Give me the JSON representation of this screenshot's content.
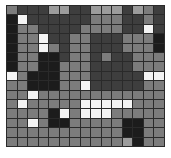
{
  "grid": {
    "rows": 15,
    "cols": 15,
    "palette": {
      "W": "#f4f4f4",
      "L": "#9c9c9c",
      "M": "#7c7c7c",
      "D": "#3e3e3e",
      "K": "#1c1c1c"
    },
    "cells": [
      "MDDDLLDDLLLDLMD",
      "KWDDDDDDMMMDDMD",
      "KMMDDDDMMMMDDWD",
      "KMMWDDMMDDDMMMK",
      "KMMWMDMMDDDMMMK",
      "KMMKKDMMDMDDMMM",
      "KMMKKMMMDDDDMMM",
      "WMKKKMMMDDDDDWW",
      "MMKKKMMWDDDDDMM",
      "MMWMMMMMMMMMMMM",
      "MWMMMMMWWWWWMMM",
      "MMMMKWMWWWMMMMM",
      "MMWMKKMMMMMKKMM",
      "MMMMMMMMMMMKKMM",
      "MMMMMMMMMMMLKMM"
    ]
  }
}
